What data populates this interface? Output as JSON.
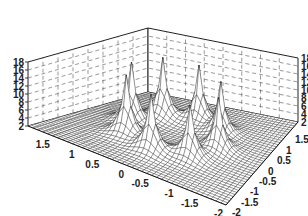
{
  "chart_data": {
    "type": "surface3d",
    "title": "",
    "xlabel": "",
    "ylabel": "",
    "zlabel": "",
    "x_ticks": [
      "-2",
      "-1.5",
      "-1",
      "-0.5",
      "0",
      "0.5",
      "1",
      "1.5"
    ],
    "y_ticks": [
      "-2",
      "-1.5",
      "-1",
      "-0.5",
      "0",
      "0.5",
      "1",
      "1.5"
    ],
    "z_ticks": [
      "2",
      "4",
      "6",
      "8",
      "10",
      "12",
      "14",
      "16",
      "18"
    ],
    "xlim": [
      -2,
      2
    ],
    "ylim": [
      -2,
      2
    ],
    "zlim": [
      2,
      18
    ],
    "grid": true,
    "legend": false,
    "surface": {
      "base_value": 2,
      "description": "Flat base near z=2 with eight sharp peaks arranged on a ring around the origin, each reaching roughly z=15-17",
      "peaks": [
        {
          "x": 0.0,
          "y": 1.0,
          "z": 17
        },
        {
          "x": 0.7,
          "y": 0.7,
          "z": 17
        },
        {
          "x": 1.0,
          "y": 0.0,
          "z": 16
        },
        {
          "x": 0.7,
          "y": -0.7,
          "z": 15
        },
        {
          "x": 0.0,
          "y": -1.0,
          "z": 15
        },
        {
          "x": -0.7,
          "y": -0.7,
          "z": 15
        },
        {
          "x": -1.0,
          "y": 0.0,
          "z": 16
        },
        {
          "x": -0.7,
          "y": 0.7,
          "z": 17
        }
      ]
    },
    "colors": {
      "mesh": "#1a1a1a",
      "face": "#ffffff",
      "grid": "#555555"
    }
  }
}
